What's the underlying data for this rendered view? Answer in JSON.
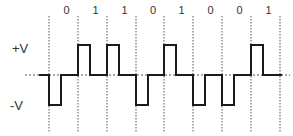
{
  "diagram": {
    "type": "digital-signal-encoding",
    "bits": [
      "0",
      "1",
      "1",
      "0",
      "1",
      "0",
      "0",
      "1"
    ],
    "level_labels": {
      "high": "+V",
      "low": "-V"
    },
    "bit_levels": [
      -1,
      1,
      1,
      -1,
      1,
      -1,
      -1,
      1
    ],
    "boundaries_x": [
      49,
      78,
      107,
      136,
      164,
      193,
      222,
      251,
      280
    ],
    "colors": {
      "signal": "#1a1a1a",
      "grid": "#555555",
      "text": "#333333"
    }
  }
}
